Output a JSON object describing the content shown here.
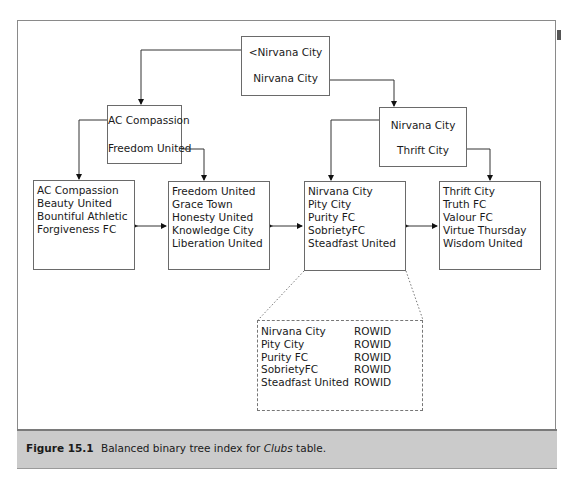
{
  "figure": {
    "caption": {
      "label": "Figure 15.1",
      "text_before": "Balanced binary tree index for ",
      "text_italic": "Clubs",
      "text_after": " table."
    }
  },
  "tree": {
    "root": {
      "keys": [
        "<Nirvana City",
        "Nirvana City"
      ]
    },
    "left_branch": {
      "keys": [
        "AC Compassion",
        "Freedom United"
      ]
    },
    "right_branch": {
      "keys": [
        "Nirvana City",
        "Thrift City"
      ]
    },
    "leaves": [
      {
        "entries": [
          "AC Compassion",
          "Beauty United",
          "Bountiful Athletic",
          "Forgiveness FC"
        ]
      },
      {
        "entries": [
          "Freedom United",
          "Grace Town",
          "Honesty United",
          "Knowledge City",
          "Liberation United"
        ]
      },
      {
        "entries": [
          "Nirvana City",
          "Pity City",
          "Purity FC",
          "SobrietyFC",
          "Steadfast United"
        ]
      },
      {
        "entries": [
          "Thrift City",
          "Truth FC",
          "Valour FC",
          "Virtue Thursday",
          "Wisdom United"
        ]
      }
    ],
    "leaf_detail": {
      "rows": [
        {
          "key": "Nirvana City",
          "pointer": "ROWID"
        },
        {
          "key": "Pity City",
          "pointer": "ROWID"
        },
        {
          "key": "Purity FC",
          "pointer": "ROWID"
        },
        {
          "key": "SobrietyFC",
          "pointer": "ROWID"
        },
        {
          "key": "Steadfast United",
          "pointer": "ROWID"
        }
      ]
    }
  }
}
